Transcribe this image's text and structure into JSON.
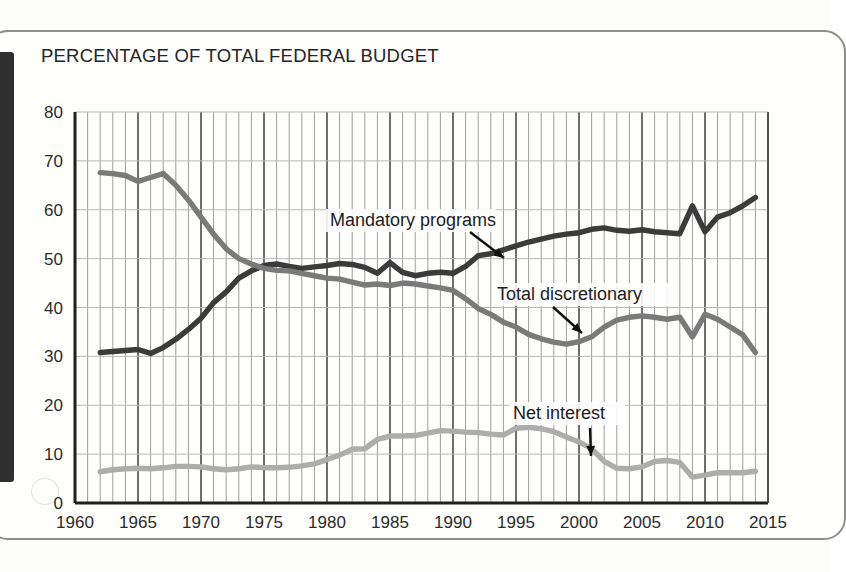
{
  "chart_title": "PERCENTAGE OF TOTAL FEDERAL BUDGET",
  "annotations": {
    "mandatory": "Mandatory programs",
    "discretionary": "Total discretionary",
    "net_interest": "Net interest"
  },
  "colors": {
    "mandatory": "#3b3b3b",
    "discretionary": "#7a7a7a",
    "net_interest": "#adadad",
    "grid_major": "#4a4a4a",
    "grid_minor": "#9d9d9d",
    "axis": "#1f1f1f",
    "text": "#252525",
    "page": "#fefefd",
    "frame": "#8d8d8d",
    "spine": "#2f2f2f"
  },
  "chart_data": {
    "type": "line",
    "title": "PERCENTAGE OF TOTAL FEDERAL BUDGET",
    "xlabel": "",
    "ylabel": "",
    "xlim": [
      1960,
      2015
    ],
    "ylim": [
      0,
      80
    ],
    "yticks": [
      0,
      10,
      20,
      30,
      40,
      50,
      60,
      70,
      80
    ],
    "xticks": [
      1960,
      1965,
      1970,
      1975,
      1980,
      1985,
      1990,
      1995,
      2000,
      2005,
      2010,
      2015
    ],
    "xtick_labels": [
      "1960",
      "1965",
      "1970",
      "1975",
      "1980",
      "1985",
      "1990",
      "1995",
      "2000",
      "2005",
      "2010",
      "2015"
    ],
    "ytick_labels": [
      "0",
      "10",
      "20",
      "30",
      "40",
      "50",
      "60",
      "70",
      "80"
    ],
    "grid": true,
    "grid_minor_x_step": 1,
    "legend": "annotated-inline",
    "x": [
      1962,
      1963,
      1964,
      1965,
      1966,
      1967,
      1968,
      1969,
      1970,
      1971,
      1972,
      1973,
      1974,
      1975,
      1976,
      1977,
      1978,
      1979,
      1980,
      1981,
      1982,
      1983,
      1984,
      1985,
      1986,
      1987,
      1988,
      1989,
      1990,
      1991,
      1992,
      1993,
      1994,
      1995,
      1996,
      1997,
      1998,
      1999,
      2000,
      2001,
      2002,
      2003,
      2004,
      2005,
      2006,
      2007,
      2008,
      2009,
      2010,
      2011,
      2012,
      2013,
      2014
    ],
    "series": [
      {
        "name": "Mandatory programs",
        "color": "#3b3b3b",
        "values": [
          30.8,
          31.0,
          31.2,
          31.4,
          30.6,
          31.8,
          33.5,
          35.5,
          37.8,
          41.0,
          43.2,
          46.0,
          47.5,
          48.6,
          48.9,
          48.4,
          48.0,
          48.3,
          48.6,
          49.0,
          48.8,
          48.2,
          47.0,
          49.2,
          47.2,
          46.5,
          47.0,
          47.2,
          47.0,
          48.4,
          50.6,
          51.0,
          51.8,
          52.6,
          53.4,
          54.0,
          54.6,
          55.0,
          55.3,
          56.0,
          56.3,
          55.8,
          55.6,
          55.9,
          55.5,
          55.3,
          55.1,
          60.8,
          55.5,
          58.5,
          59.4,
          60.8,
          62.5
        ]
      },
      {
        "name": "Total discretionary",
        "color": "#7a7a7a",
        "values": [
          67.6,
          67.4,
          67.0,
          65.8,
          66.6,
          67.4,
          65.0,
          62.0,
          58.5,
          55.0,
          52.0,
          50.0,
          48.9,
          48.0,
          47.6,
          47.5,
          47.0,
          46.5,
          46.0,
          45.8,
          45.2,
          44.6,
          44.8,
          44.5,
          45.0,
          44.8,
          44.4,
          44.0,
          43.5,
          41.8,
          39.8,
          38.6,
          37.0,
          36.0,
          34.5,
          33.6,
          32.9,
          32.5,
          33.0,
          34.0,
          36.0,
          37.4,
          38.0,
          38.3,
          38.0,
          37.6,
          38.0,
          34.0,
          38.6,
          37.6,
          36.0,
          34.4,
          30.8
        ]
      },
      {
        "name": "Net interest",
        "color": "#adadad",
        "values": [
          6.4,
          6.8,
          7.0,
          7.1,
          7.0,
          7.2,
          7.5,
          7.5,
          7.4,
          7.0,
          6.8,
          7.0,
          7.4,
          7.2,
          7.2,
          7.3,
          7.6,
          8.0,
          8.9,
          9.8,
          11.0,
          11.1,
          13.0,
          13.7,
          13.7,
          13.8,
          14.3,
          14.8,
          14.7,
          14.5,
          14.4,
          14.1,
          13.9,
          15.3,
          15.5,
          15.2,
          14.6,
          13.5,
          12.5,
          11.1,
          8.5,
          7.1,
          7.0,
          7.4,
          8.5,
          8.7,
          8.3,
          5.3,
          5.7,
          6.2,
          6.2,
          6.2,
          6.5
        ]
      }
    ]
  }
}
